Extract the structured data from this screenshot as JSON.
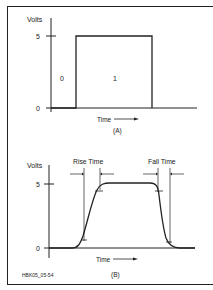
{
  "panel_a": {
    "ylabel": "Volts",
    "y_high": "5",
    "y_low": "0",
    "state_low": "0",
    "state_high": "1",
    "xlabel": "Time",
    "caption": "(A)"
  },
  "panel_b": {
    "ylabel": "Volts",
    "y_high": "5",
    "y_low": "0",
    "rise_label": "Rise Time",
    "fall_label": "Fall Time",
    "xlabel": "Time",
    "caption": "(B)"
  },
  "figure_id": "HBK05_05-54"
}
